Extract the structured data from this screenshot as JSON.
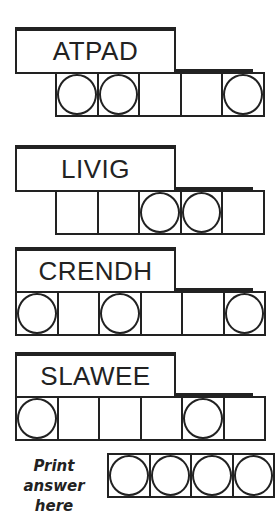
{
  "puzzles": [
    {
      "scrambled": "ATPAD",
      "cells": 5,
      "circled": [
        0,
        1,
        4
      ]
    },
    {
      "scrambled": "LIVIG",
      "cells": 5,
      "circled": [
        2,
        3
      ]
    },
    {
      "scrambled": "CRENDH",
      "cells": 6,
      "circled": [
        0,
        2,
        5
      ]
    },
    {
      "scrambled": "SLAWEE",
      "cells": 6,
      "circled": [
        0,
        4
      ]
    }
  ],
  "answer": {
    "label_line1": "Print answer",
    "label_line2": "here",
    "cells": 4,
    "circled": [
      0,
      1,
      2,
      3
    ]
  }
}
